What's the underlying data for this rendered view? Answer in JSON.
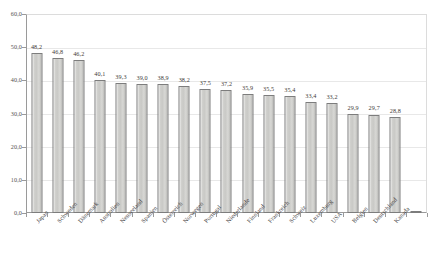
{
  "chart_data": {
    "type": "bar",
    "title": "",
    "subtitle": "",
    "xlabel": "",
    "ylabel": "",
    "ylim": [
      0.0,
      60.0
    ],
    "y_tick_step": 10.0,
    "y_ticks": [
      "0,0",
      "10,0",
      "20,0",
      "30,0",
      "40,0",
      "50,0",
      "60,0"
    ],
    "y_tick_values": [
      0.0,
      10.0,
      20.0,
      30.0,
      40.0,
      50.0,
      60.0
    ],
    "grid": true,
    "grid_axis": "y",
    "legend": false,
    "legend_position": "none",
    "decimal_separator": ",",
    "data_labels": true,
    "categories": [
      "Japan",
      "Schweden",
      "Dänemark",
      "Australien",
      "Neuseeland",
      "Spanien",
      "Österreich",
      "Norwegen",
      "Portugal",
      "Niederlande",
      "Finnland",
      "Frankreich",
      "Schweiz",
      "Luxemburg",
      "USA",
      "Belgien",
      "Deutschland",
      "Kanada"
    ],
    "values": [
      48.2,
      46.8,
      46.2,
      40.1,
      39.3,
      39.0,
      38.9,
      38.2,
      37.5,
      37.2,
      35.9,
      35.5,
      35.4,
      33.4,
      33.2,
      29.9,
      29.7,
      28.8
    ],
    "value_labels": [
      "48,2",
      "46,8",
      "46,2",
      "40,1",
      "39,3",
      "39,0",
      "38,9",
      "38,2",
      "37,5",
      "37,2",
      "35,9",
      "35,5",
      "35,4",
      "33,4",
      "33,2",
      "29,9",
      "29,7",
      "28,8"
    ],
    "bar_count": 19,
    "colors": {
      "bar_fill": "#cccccc",
      "bar_edge": "#7d7d7d",
      "gridline": "#e8e8e8",
      "axis": "#9a9a9a",
      "text": "#45423f",
      "background": "#ffffff"
    }
  }
}
